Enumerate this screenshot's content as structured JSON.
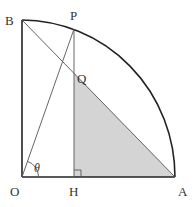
{
  "diagram": {
    "type": "geometry-quarter-circle",
    "points": {
      "O": {
        "label": "O",
        "x": 22,
        "y": 177
      },
      "A": {
        "label": "A",
        "x": 175,
        "y": 177
      },
      "B": {
        "label": "B",
        "x": 22,
        "y": 20
      },
      "P": {
        "label": "P",
        "x": 74,
        "y": 29
      },
      "H": {
        "label": "H",
        "x": 74,
        "y": 177
      },
      "Q": {
        "label": "Q",
        "x": 74,
        "y": 73
      }
    },
    "angle_label": "θ",
    "shaded_region": "triangle QHA",
    "right_angle_at": "H",
    "colors": {
      "stroke": "#222222",
      "thin_stroke": "#555555",
      "shade": "#d4d4d4",
      "text": "#333333"
    }
  }
}
